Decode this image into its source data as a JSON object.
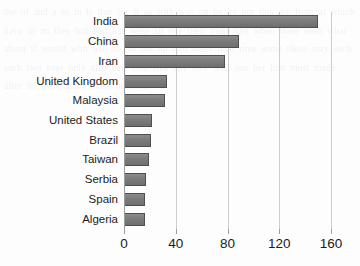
{
  "chart_data": {
    "type": "bar",
    "orientation": "horizontal",
    "title": "",
    "subtitle": "",
    "xlabel": "",
    "ylabel": "",
    "categories": [
      "India",
      "China",
      "Iran",
      "United Kingdom",
      "Malaysia",
      "United States",
      "Brazil",
      "Taiwan",
      "Serbia",
      "Spain",
      "Algeria"
    ],
    "values": [
      150,
      89,
      78,
      33,
      32,
      22,
      21,
      19,
      17,
      16,
      16
    ],
    "xlim": [
      0,
      160
    ],
    "ylim": null,
    "xticks": [
      0,
      40,
      80,
      120,
      160
    ],
    "xtick_labels": [
      "0",
      "40",
      "80",
      "120",
      "160"
    ],
    "grid": "vertical",
    "legend": null,
    "annotations": [],
    "colors": {
      "bar_fill": "#7b7b7b",
      "bar_border": "#4f4f4f",
      "gridline": "#cdcdcd",
      "axis": "#9d9d9d",
      "text": "#1c1c1c",
      "background": "#fdfdfd"
    }
  },
  "background_ghost_text": "the of and a to in is that for it as with was on be by not this are from at which have or an they but had has were all one their more can when there been what about if would who will so no out up into other than time some these may such such two over only also new first like any now well our her him most made after its own under those between"
}
